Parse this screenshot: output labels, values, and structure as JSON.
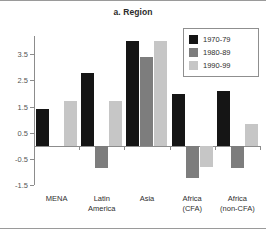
{
  "chart_data": {
    "type": "bar",
    "title": "a. Region",
    "xlabel": "",
    "ylabel": "",
    "ylim": [
      -1.5,
      4.2
    ],
    "yticks": [
      3.5,
      2.5,
      1.5,
      0.5,
      -0.5,
      -1.5
    ],
    "ytick_labels": [
      "3.5",
      "2.5",
      "1.5",
      "0.5",
      "-0.5",
      "-1.5"
    ],
    "grid": false,
    "legend_position": "top-right",
    "categories": [
      "MENA",
      "Latin\nAmerica",
      "Asia",
      "Africa\n(CFA)",
      "Africa\n(non-CFA)"
    ],
    "series": [
      {
        "name": "1970-79",
        "color": "#151515",
        "values": [
          1.4,
          2.8,
          4.0,
          2.0,
          2.1
        ]
      },
      {
        "name": "1980-89",
        "color": "#7d7d7d",
        "values": [
          null,
          -0.85,
          3.4,
          -1.25,
          -0.85
        ]
      },
      {
        "name": "1990-99",
        "color": "#c6c6c6",
        "values": [
          1.7,
          1.7,
          4.0,
          -0.8,
          0.85
        ]
      }
    ]
  }
}
